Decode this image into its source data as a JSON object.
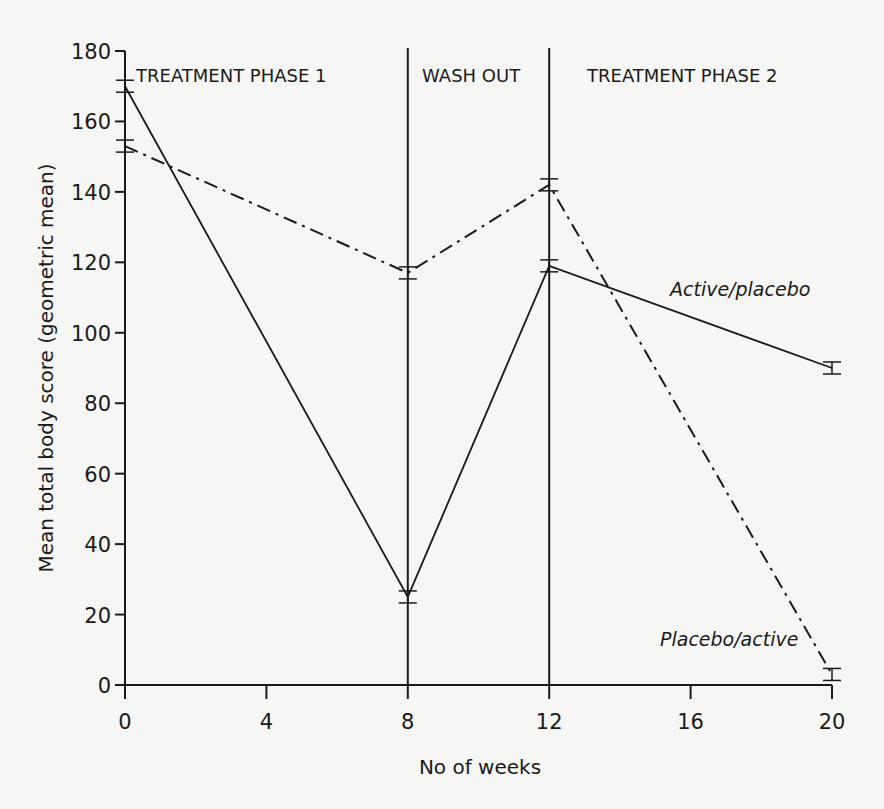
{
  "chart_data": {
    "type": "line",
    "title": "",
    "xlabel": "No of weeks",
    "ylabel": "Mean total body score (geometric mean)",
    "xlim": [
      0,
      20
    ],
    "ylim": [
      0,
      180
    ],
    "x_ticks": [
      0,
      4,
      8,
      12,
      16,
      20
    ],
    "y_ticks": [
      0,
      20,
      40,
      60,
      80,
      100,
      120,
      140,
      160,
      180
    ],
    "grid": false,
    "phases": [
      {
        "label": "TREATMENT PHASE 1",
        "start": 0,
        "end": 8
      },
      {
        "label": "WASH OUT",
        "start": 8,
        "end": 12
      },
      {
        "label": "TREATMENT PHASE 2",
        "start": 12,
        "end": 20
      }
    ],
    "phase_dividers": [
      8,
      12
    ],
    "x": [
      0,
      8,
      12,
      20
    ],
    "series": [
      {
        "name": "Active/placebo",
        "style": "solid",
        "values": [
          170,
          25,
          119,
          90
        ]
      },
      {
        "name": "Placebo/active",
        "style": "dash-dot",
        "values": [
          153,
          117,
          142,
          3
        ]
      }
    ]
  },
  "labels": {
    "phase1": "TREATMENT PHASE 1",
    "washout": "WASH OUT",
    "phase2": "TREATMENT PHASE 2",
    "series_active": "Active/placebo",
    "series_placebo": "Placebo/active",
    "xlabel": "No of weeks",
    "ylabel": "Mean total body score (geometric mean)"
  },
  "colors": {
    "background": "#f6f6f4",
    "ink": "#1a1a1a"
  }
}
